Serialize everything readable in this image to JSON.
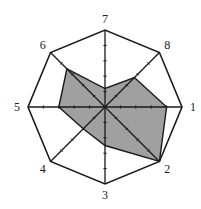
{
  "chart_data": {
    "type": "radar",
    "title": "",
    "axes": [
      "1",
      "2",
      "3",
      "4",
      "5",
      "6",
      "7",
      "8"
    ],
    "values": [
      4.0,
      5.0,
      2.5,
      2.0,
      3.0,
      3.5,
      1.2,
      2.7
    ],
    "scale_max": 5,
    "tick_count": 5,
    "grid": "outer octagon only",
    "legend": "none",
    "fill_color": "#a0a0a0",
    "line_color": "#1a1a1a"
  }
}
